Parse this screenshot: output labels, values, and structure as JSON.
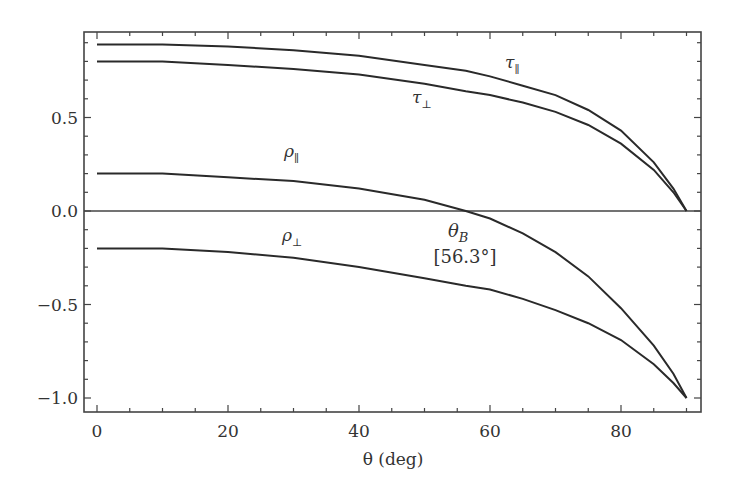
{
  "chart_data": {
    "type": "line",
    "title": "",
    "xlabel": "θ (deg)",
    "ylabel": "",
    "xlim": [
      -2,
      92
    ],
    "ylim": [
      -1.05,
      0.95
    ],
    "x_ticks": [
      0,
      20,
      40,
      60,
      80
    ],
    "x_tick_labels": [
      "0",
      "20",
      "40",
      "60",
      "80"
    ],
    "x_minor_step": 5,
    "y_ticks": [
      -1.0,
      -0.5,
      0.0,
      0.5
    ],
    "y_tick_labels": [
      "−1.0",
      "−0.5",
      "0.0",
      "0.5"
    ],
    "y_minor_step": 0.1,
    "grid": false,
    "legend": "none (inline curve labels)",
    "zero_line": true,
    "x": [
      0,
      10,
      20,
      30,
      40,
      50,
      56.3,
      60,
      65,
      70,
      75,
      80,
      85,
      88,
      90
    ],
    "series": [
      {
        "name": "τ∥",
        "label_main": "τ",
        "label_sub": "∥",
        "values": [
          0.89,
          0.89,
          0.88,
          0.86,
          0.83,
          0.78,
          0.75,
          0.72,
          0.67,
          0.62,
          0.54,
          0.43,
          0.26,
          0.12,
          0.0
        ]
      },
      {
        "name": "τ⊥",
        "label_main": "τ",
        "label_sub": "⊥",
        "values": [
          0.8,
          0.8,
          0.78,
          0.76,
          0.73,
          0.68,
          0.64,
          0.62,
          0.58,
          0.53,
          0.46,
          0.36,
          0.22,
          0.1,
          0.0
        ]
      },
      {
        "name": "ρ∥",
        "label_main": "ρ",
        "label_sub": "∥",
        "values": [
          0.2,
          0.2,
          0.18,
          0.16,
          0.12,
          0.06,
          0.0,
          -0.04,
          -0.12,
          -0.22,
          -0.35,
          -0.52,
          -0.72,
          -0.87,
          -1.0
        ]
      },
      {
        "name": "ρ⊥",
        "label_main": "ρ",
        "label_sub": "⊥",
        "values": [
          -0.2,
          -0.2,
          -0.22,
          -0.25,
          -0.3,
          -0.36,
          -0.4,
          -0.42,
          -0.47,
          -0.53,
          -0.6,
          -0.69,
          -0.82,
          -0.92,
          -1.0
        ]
      }
    ],
    "annotations": [
      {
        "text_main": "θ",
        "text_sub": "B",
        "text_second_line": "[56.3°]",
        "x": 56.3,
        "y": 0.0
      }
    ]
  }
}
